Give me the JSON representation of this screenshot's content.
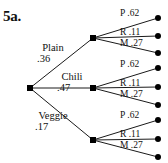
{
  "figure": {
    "problem_number": "5a.",
    "type": "probability-tree-diagram"
  },
  "tree": {
    "root": {
      "x": 30,
      "y": 88
    },
    "level1": [
      {
        "id": "plain",
        "name": "Plain",
        "probability": ".36",
        "node": {
          "x": 93,
          "y": 38
        },
        "label_pos": {
          "x": 38,
          "y": 44
        },
        "children": [
          {
            "id": "plain-p",
            "letter": "P",
            "probability": ".62",
            "leaf": {
              "x": 158,
              "y": 18
            },
            "label_pos": {
              "x": 119,
              "y": 10
            }
          },
          {
            "id": "plain-r",
            "letter": "R",
            "probability": ".11",
            "leaf": {
              "x": 158,
              "y": 36
            },
            "label_pos": {
              "x": 119,
              "y": 28
            }
          },
          {
            "id": "plain-m",
            "letter": "M",
            "probability": ".27",
            "leaf": {
              "x": 158,
              "y": 53
            },
            "label_pos": {
              "x": 119,
              "y": 39
            }
          }
        ]
      },
      {
        "id": "chili",
        "name": "Chili",
        "probability": ".47",
        "node": {
          "x": 93,
          "y": 88
        },
        "label_pos": {
          "x": 58,
          "y": 72
        },
        "children": [
          {
            "id": "chili-p",
            "letter": "P",
            "probability": ".62",
            "leaf": {
              "x": 158,
              "y": 68
            },
            "label_pos": {
              "x": 119,
              "y": 61
            }
          },
          {
            "id": "chili-r",
            "letter": "R",
            "probability": ".11",
            "leaf": {
              "x": 158,
              "y": 87
            },
            "label_pos": {
              "x": 119,
              "y": 79
            }
          },
          {
            "id": "chili-m",
            "letter": "M",
            "probability": ".27",
            "leaf": {
              "x": 158,
              "y": 105
            },
            "label_pos": {
              "x": 119,
              "y": 90
            }
          }
        ]
      },
      {
        "id": "veggie",
        "name": "Veggie",
        "probability": ".17",
        "node": {
          "x": 93,
          "y": 140
        },
        "label_pos": {
          "x": 36,
          "y": 112
        },
        "children": [
          {
            "id": "veggie-p",
            "letter": "P",
            "probability": ".62",
            "leaf": {
              "x": 158,
              "y": 120
            },
            "label_pos": {
              "x": 119,
              "y": 112
            }
          },
          {
            "id": "veggie-r",
            "letter": "R",
            "probability": ".11",
            "leaf": {
              "x": 158,
              "y": 139
            },
            "label_pos": {
              "x": 119,
              "y": 131
            }
          },
          {
            "id": "veggie-m",
            "letter": "M",
            "probability": ".27",
            "leaf": {
              "x": 158,
              "y": 157
            },
            "label_pos": {
              "x": 119,
              "y": 142
            }
          }
        ]
      }
    ]
  },
  "labels": {
    "plain_name": "Plain",
    "plain_prob": ".36",
    "chili_name": "Chili",
    "chili_prob": ".47",
    "veggie_name": "Veggie",
    "veggie_prob": ".17",
    "plain_p": "P .62",
    "plain_r": "R .11",
    "plain_m": "M .27",
    "chili_p": "P .62",
    "chili_r": "R .11",
    "chili_m": "M .27",
    "veggie_p": "P .62",
    "veggie_r": "R .11",
    "veggie_m": "M .27"
  },
  "colors": {
    "background": "#ffffff",
    "ink": "#111111",
    "line": "#1a1a1a"
  }
}
